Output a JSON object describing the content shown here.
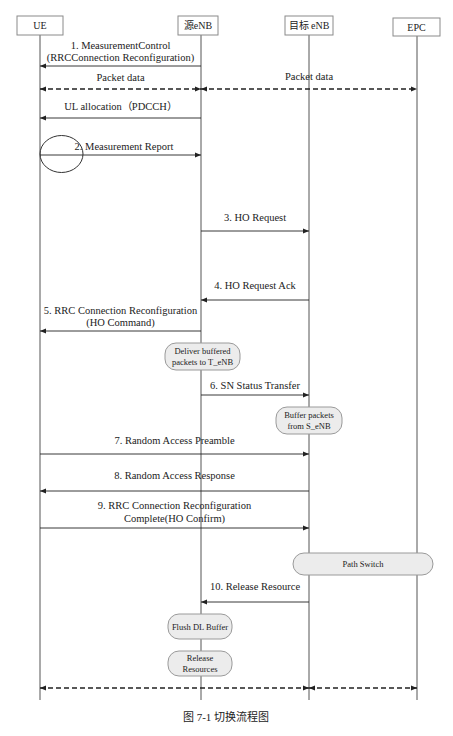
{
  "participants": [
    {
      "id": "ue",
      "label": "UE"
    },
    {
      "id": "senb",
      "label": "源eNB"
    },
    {
      "id": "tenb",
      "label": "目标 eNB"
    },
    {
      "id": "epc",
      "label": "EPC"
    }
  ],
  "messages": [
    {
      "id": "m1",
      "from": "senb",
      "to": "ue",
      "style": "solid",
      "lines": [
        "1. MeasurementControl",
        "(RRCConnection Reconfiguration)"
      ]
    },
    {
      "id": "pd1",
      "from": "ue",
      "to": "senb",
      "style": "dashed-both",
      "lines": [
        "Packet data"
      ]
    },
    {
      "id": "pd2",
      "from": "senb",
      "to": "epc",
      "style": "dashed-both",
      "lines": [
        "Packet data"
      ]
    },
    {
      "id": "ul",
      "from": "senb",
      "to": "ue",
      "style": "solid",
      "lines": [
        "UL allocation（PDCCH）"
      ]
    },
    {
      "id": "m2",
      "from": "ue",
      "to": "senb",
      "style": "solid",
      "lines": [
        "2. Measurement Report"
      ]
    },
    {
      "id": "m3",
      "from": "senb",
      "to": "tenb",
      "style": "solid",
      "lines": [
        "3. HO Request"
      ]
    },
    {
      "id": "m4",
      "from": "tenb",
      "to": "senb",
      "style": "solid",
      "lines": [
        "4. HO Request Ack"
      ]
    },
    {
      "id": "m5",
      "from": "senb",
      "to": "ue",
      "style": "solid",
      "lines": [
        "5. RRC Connection Reconfiguration",
        "(HO Command)"
      ]
    },
    {
      "id": "m6",
      "from": "senb",
      "to": "tenb",
      "style": "solid",
      "lines": [
        "6. SN Status Transfer"
      ]
    },
    {
      "id": "m7",
      "from": "ue",
      "to": "tenb",
      "style": "solid",
      "lines": [
        "7. Random Access Preamble"
      ]
    },
    {
      "id": "m8",
      "from": "tenb",
      "to": "ue",
      "style": "solid",
      "lines": [
        "8. Random Access Response"
      ]
    },
    {
      "id": "m9",
      "from": "ue",
      "to": "tenb",
      "style": "solid",
      "lines": [
        "9. RRC Connection Reconfiguration",
        "Complete(HO Confirm)"
      ]
    },
    {
      "id": "m10",
      "from": "tenb",
      "to": "senb",
      "style": "solid",
      "lines": [
        "10. Release Resource"
      ]
    },
    {
      "id": "pd3",
      "from": "ue",
      "to": "tenb",
      "style": "dashed-both",
      "lines": []
    },
    {
      "id": "pd4",
      "from": "tenb",
      "to": "epc",
      "style": "dashed-both",
      "lines": []
    }
  ],
  "actions": [
    {
      "id": "deliver",
      "on": "senb",
      "lines": [
        "Deliver buffered",
        "packets to T_eNB"
      ]
    },
    {
      "id": "buffer",
      "on": "tenb",
      "lines": [
        "Buffer packets",
        "from S_eNB"
      ]
    },
    {
      "id": "pathswitch",
      "on": "tenb-epc",
      "lines": [
        "Path Switch"
      ]
    },
    {
      "id": "flush",
      "on": "senb",
      "lines": [
        "Flush DL Buffer"
      ]
    },
    {
      "id": "release",
      "on": "senb",
      "lines": [
        "Release",
        "Resources"
      ]
    }
  ],
  "caption": "图 7-1    切换流程图",
  "colors": {
    "line": "#555555",
    "action_fill": "#ececec",
    "action_stroke": "#9a9a9a",
    "header_stroke": "#8a8a8a"
  }
}
